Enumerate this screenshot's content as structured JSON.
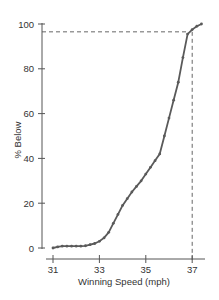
{
  "chart_data": {
    "type": "line",
    "title": "",
    "xlabel": "Winning Speed (mph)",
    "ylabel": "% Below",
    "xlim": [
      30.8,
      37.6
    ],
    "ylim": [
      0,
      100
    ],
    "x_ticks": [
      31,
      33,
      35,
      37
    ],
    "y_ticks": [
      0,
      20,
      40,
      60,
      80,
      100
    ],
    "grid": false,
    "legend": null,
    "series": [
      {
        "name": "Cumulative % Below",
        "x": [
          31.0,
          31.2,
          31.4,
          31.6,
          31.8,
          32.0,
          32.2,
          32.4,
          32.6,
          32.8,
          33.0,
          33.2,
          33.4,
          33.6,
          33.8,
          34.0,
          34.2,
          34.4,
          34.6,
          34.8,
          35.0,
          35.2,
          35.4,
          35.6,
          35.8,
          36.0,
          36.2,
          36.4,
          36.6,
          36.8,
          37.0,
          37.2,
          37.4
        ],
        "y": [
          0,
          0.5,
          0.8,
          0.8,
          0.8,
          0.8,
          0.8,
          1.0,
          1.5,
          2,
          3,
          4.5,
          7,
          11,
          15,
          19,
          22,
          25,
          27.5,
          30,
          33,
          36,
          39,
          42,
          50,
          58,
          66,
          74,
          85,
          95.5,
          97.5,
          99,
          100
        ]
      }
    ],
    "annotations": [
      {
        "type": "hline-dashed",
        "y": 96.5,
        "x_from": 31,
        "x_to": 36.85
      },
      {
        "type": "vline-dashed",
        "x": 37,
        "y_from": 0,
        "y_to": 96.5
      }
    ]
  },
  "axes": {
    "x_title": "Winning Speed (mph)",
    "y_title": "% Below",
    "x_tick_labels": [
      "31",
      "33",
      "35",
      "37"
    ],
    "y_tick_labels": [
      "0",
      "20",
      "40",
      "60",
      "80",
      "100"
    ]
  },
  "colors": {
    "line": "#5a5a5a",
    "axis": "#555555",
    "dash": "#555555",
    "text": "#333333"
  }
}
